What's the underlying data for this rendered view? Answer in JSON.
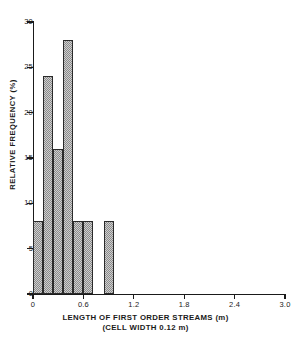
{
  "chart_data": {
    "type": "bar",
    "title": "",
    "subtitle": "",
    "xlabel": "LENGTH OF FIRST ORDER STREAMS (m)",
    "xlabel_note": "(CELL WIDTH 0.12 m)",
    "ylabel": "RELATIVE FREQUENCY (%)",
    "xlim": [
      0,
      3.0
    ],
    "ylim": [
      0,
      30
    ],
    "grid": false,
    "legend": null,
    "bin_width": 0.12,
    "bin_width_units": "m",
    "x_ticks": [
      {
        "value": 0,
        "label": "0"
      },
      {
        "value": 0.6,
        "label": "0.6"
      },
      {
        "value": 1.2,
        "label": "1.2"
      },
      {
        "value": 1.8,
        "label": "1.8"
      },
      {
        "value": 2.4,
        "label": "2.4"
      },
      {
        "value": 3.0,
        "label": "3.0"
      }
    ],
    "y_ticks": [
      {
        "value": 0,
        "label": "0"
      },
      {
        "value": 5,
        "label": "5"
      },
      {
        "value": 10,
        "label": "10"
      },
      {
        "value": 15,
        "label": "15"
      },
      {
        "value": 20,
        "label": "20"
      },
      {
        "value": 25,
        "label": "25"
      },
      {
        "value": 30,
        "label": "30"
      }
    ],
    "bins": [
      {
        "x0": 0.0,
        "x1": 0.12,
        "value": 8
      },
      {
        "x0": 0.12,
        "x1": 0.24,
        "value": 24
      },
      {
        "x0": 0.24,
        "x1": 0.36,
        "value": 16
      },
      {
        "x0": 0.36,
        "x1": 0.48,
        "value": 28
      },
      {
        "x0": 0.48,
        "x1": 0.6,
        "value": 8
      },
      {
        "x0": 0.6,
        "x1": 0.72,
        "value": 8
      },
      {
        "x0": 0.72,
        "x1": 0.84,
        "value": 0
      },
      {
        "x0": 0.84,
        "x1": 0.96,
        "value": 8
      }
    ],
    "categories": [
      "0.00-0.12",
      "0.12-0.24",
      "0.24-0.36",
      "0.36-0.48",
      "0.48-0.60",
      "0.60-0.72",
      "0.72-0.84",
      "0.84-0.96"
    ],
    "values": [
      8,
      24,
      16,
      28,
      8,
      8,
      0,
      8
    ],
    "colors": {
      "bar_fill": "#cfcfcf",
      "bar_hatch": "#8a8a8a",
      "bar_edge": "#2a2a2a",
      "axis": "#1a1a1a",
      "background": "#ffffff"
    }
  }
}
